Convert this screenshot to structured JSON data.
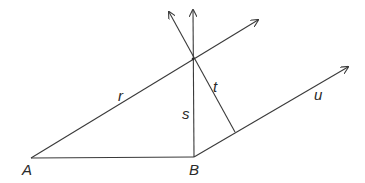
{
  "diagram": {
    "points": {
      "A": {
        "label": "A",
        "x": 31,
        "y": 158
      },
      "B": {
        "label": "B",
        "x": 194,
        "y": 157
      },
      "P": {
        "x": 193,
        "y": 59
      }
    },
    "lines": {
      "r": {
        "label": "r",
        "from": [
          31,
          158
        ],
        "to": [
          258,
          20
        ],
        "arrow": true
      },
      "s": {
        "label": "s",
        "from": [
          194,
          157
        ],
        "to": [
          193,
          10
        ],
        "arrow": true
      },
      "t": {
        "label": "t",
        "from": [
          235,
          132
        ],
        "to": [
          169,
          12
        ],
        "arrow": true
      },
      "u": {
        "label": "u",
        "from": [
          194,
          157
        ],
        "to": [
          348,
          67
        ],
        "arrow": true
      },
      "AB": {
        "from": [
          31,
          158
        ],
        "to": [
          194,
          157
        ],
        "arrow": false
      }
    }
  }
}
